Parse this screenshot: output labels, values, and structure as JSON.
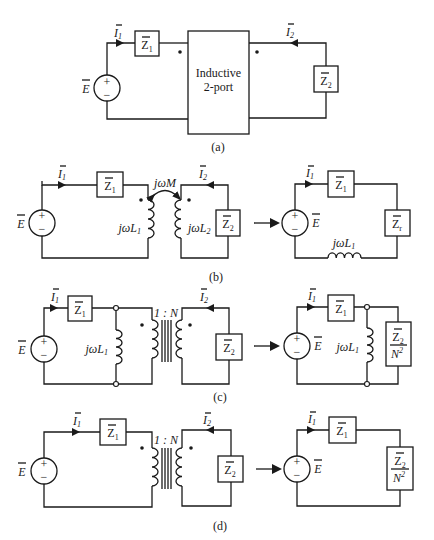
{
  "figure": {
    "panels": [
      {
        "id": "a",
        "caption": "(a)",
        "source_label": "E",
        "current_1": "I",
        "current_1_sub": "1",
        "current_2": "I",
        "current_2_sub": "2",
        "z1": "Z",
        "z1_sub": "1",
        "z2": "Z",
        "z2_sub": "2",
        "block_line1": "Inductive",
        "block_line2": "2-port"
      },
      {
        "id": "b",
        "caption": "(b)",
        "source_label": "E",
        "current_1": "I",
        "current_1_sub": "1",
        "current_2": "I",
        "current_2_sub": "2",
        "z1": "Z",
        "z1_sub": "1",
        "z2": "Z",
        "z2_sub": "2",
        "mutual": "jωM",
        "l1": "jωL",
        "l1_sub": "1",
        "l2": "jωL",
        "l2_sub": "2",
        "eq_source": "E",
        "eq_current": "I",
        "eq_current_sub": "1",
        "eq_z1": "Z",
        "eq_z1_sub": "1",
        "eq_zr": "Z",
        "eq_zr_sub": "r",
        "eq_l1": "jωL",
        "eq_l1_sub": "1"
      },
      {
        "id": "c",
        "caption": "(c)",
        "source_label": "E",
        "current_1": "I",
        "current_1_sub": "1",
        "current_2": "I",
        "current_2_sub": "2",
        "z1": "Z",
        "z1_sub": "1",
        "z2": "Z",
        "z2_sub": "2",
        "l1": "jωL",
        "l1_sub": "1",
        "ratio": "1 : N",
        "eq_source": "E",
        "eq_current": "I",
        "eq_current_sub": "1",
        "eq_z1": "Z",
        "eq_z1_sub": "1",
        "eq_l1": "jωL",
        "eq_l1_sub": "1",
        "eq_zload_num": "Z",
        "eq_zload_num_sub": "2",
        "eq_zload_den": "N",
        "eq_zload_den_sup": "2"
      },
      {
        "id": "d",
        "caption": "(d)",
        "source_label": "E",
        "current_1": "I",
        "current_1_sub": "1",
        "current_2": "I",
        "current_2_sub": "2",
        "z1": "Z",
        "z1_sub": "1",
        "z2": "Z",
        "z2_sub": "2",
        "ratio": "1 : N",
        "eq_source": "E",
        "eq_current": "I",
        "eq_current_sub": "1",
        "eq_z1": "Z",
        "eq_z1_sub": "1",
        "eq_zload_num": "Z",
        "eq_zload_num_sub": "2",
        "eq_zload_den": "N",
        "eq_zload_den_sup": "2"
      }
    ],
    "symbols": {
      "plus": "+",
      "minus": "−",
      "overbar": "‾"
    }
  }
}
